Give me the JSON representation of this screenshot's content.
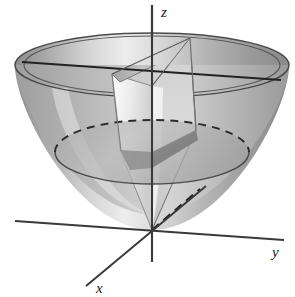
{
  "figure": {
    "kind": "3d-math-diagram",
    "background_color": "#ffffff"
  },
  "axes": {
    "origin": {
      "x": 152,
      "y": 230
    },
    "items": [
      {
        "name": "z",
        "label": "z",
        "label_pos": {
          "x": 161,
          "y": 17
        },
        "line": {
          "x1": 152,
          "y1": 5,
          "x2": 152,
          "y2": 262
        },
        "color": "#3a3a3a"
      },
      {
        "name": "y",
        "label": "y",
        "label_pos": {
          "x": 275,
          "y": 252
        },
        "line": {
          "x1": 15,
          "y1": 221,
          "x2": 284,
          "y2": 240
        },
        "color": "#3a3a3a"
      },
      {
        "name": "x",
        "label": "x",
        "label_pos": {
          "x": 100,
          "y": 290
        },
        "line": {
          "x1": 86,
          "y1": 285,
          "x2": 205,
          "y2": 187
        },
        "color": "#3a3a3a"
      }
    ]
  },
  "surface": {
    "name": "paraboloid",
    "rim": {
      "center": {
        "x": 150,
        "y": 65
      },
      "rx": 135,
      "ry": 32
    },
    "vertex": {
      "x": 152,
      "y": 230
    },
    "fill_light": "#f2f2f2",
    "fill_mid": "#c9c9c9",
    "fill_dark": "#8f8f8f",
    "outline_color": "#4a4a4a"
  },
  "cross_section": {
    "name": "mid-level-circle",
    "center": {
      "x": 152,
      "y": 152
    },
    "rx": 97,
    "ry": 32,
    "front_style": "solid",
    "back_style": "dashed",
    "dash_pattern": "7 5"
  },
  "cutaway": {
    "name": "wedge-cut",
    "description": "quarter wedge removed from front of paraboloid revealing interior",
    "fill": "#d8d8d8",
    "edge_color": "#6a6a6a"
  },
  "guides": [
    {
      "name": "chord-top-rim",
      "style": "solid",
      "from": {
        "x": 22,
        "y": 62
      },
      "to": {
        "x": 281,
        "y": 80
      }
    },
    {
      "name": "radius-dashed-lower",
      "style": "dashed",
      "from": {
        "x": 152,
        "y": 230
      },
      "to": {
        "x": 196,
        "y": 193
      }
    }
  ]
}
